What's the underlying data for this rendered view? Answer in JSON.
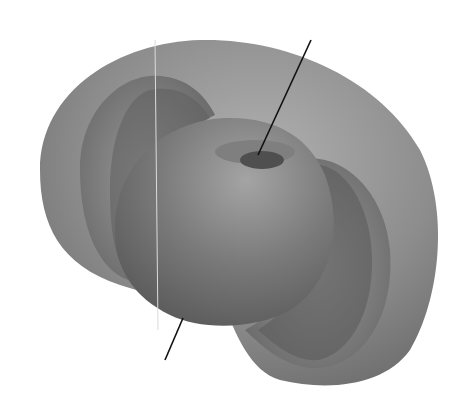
{
  "figure": {
    "colors": {
      "background": "#ffffff",
      "outer_shell": "#8a8a8a",
      "outer_shell_light": "#a8a8a8",
      "inner_cut": "#6e6e6e",
      "inner_body": "#6a6a6a",
      "inner_body_light": "#9a9a9a",
      "dimple": "#555555",
      "axis": "#111111",
      "seam": "#d8d8d8"
    }
  }
}
